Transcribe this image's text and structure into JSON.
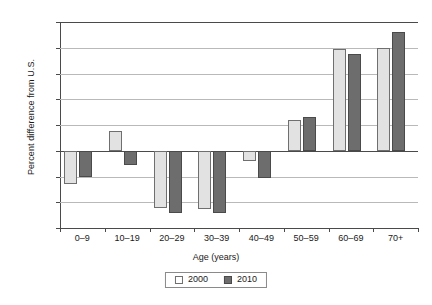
{
  "chart_data": {
    "type": "bar",
    "title": "",
    "xlabel": "Age (years)",
    "ylabel": "Percent difference from U.S.",
    "categories": [
      "0–9",
      "10–19",
      "20–29",
      "30–39",
      "40–49",
      "50–59",
      "60–69",
      "70+"
    ],
    "series": [
      {
        "name": "2000",
        "values": [
          -6.4,
          3.8,
          -11.2,
          -11.4,
          -1.9,
          6.0,
          19.8,
          20.0
        ],
        "color": "#e2e2e2"
      },
      {
        "name": "2010",
        "values": [
          -5.1,
          -2.8,
          -12.1,
          -12.1,
          -5.2,
          6.5,
          18.8,
          23.0
        ],
        "color": "#6d6d6d"
      }
    ],
    "ylim": [
      -15,
      25
    ],
    "yticks": [
      25,
      20,
      15,
      10,
      5,
      0,
      -5,
      -10,
      -15
    ],
    "ytick_labels": [
      "25",
      "20",
      "15",
      "10",
      "5",
      "0",
      "−5",
      "−10",
      "−15"
    ],
    "grid": true,
    "zero_line": 0,
    "legend_position": "bottom-center"
  }
}
